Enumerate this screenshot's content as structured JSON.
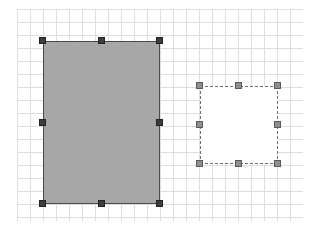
{
  "canvas": {
    "grid": {
      "spacing": 13,
      "color": "#d9d9d9"
    },
    "shapes": [
      {
        "id": "rect-filled",
        "type": "rectangle",
        "fill": "#a7a7a7",
        "stroke": "#4a4a4a",
        "stroke_style": "solid",
        "x": 43,
        "y": 41,
        "width": 117,
        "height": 163,
        "selected": true,
        "handle_color": "#3c3c3c"
      },
      {
        "id": "rect-dashed",
        "type": "rectangle",
        "fill": "#ffffff",
        "stroke": "#707070",
        "stroke_style": "dashed",
        "x": 200,
        "y": 86,
        "width": 78,
        "height": 78,
        "selected": true,
        "handle_color": "#8e8e8e"
      }
    ]
  }
}
